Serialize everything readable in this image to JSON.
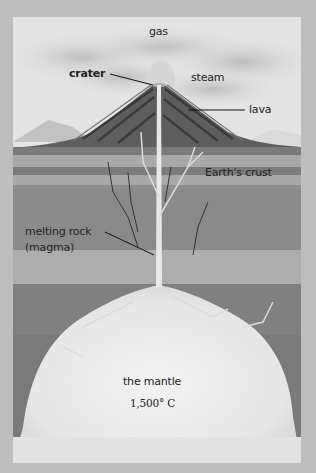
{
  "diagram": {
    "labels": {
      "gas": "gas",
      "crater": "crater",
      "steam": "steam",
      "lava": "lava",
      "crust": "Earth's crust",
      "magma_line1": "melting rock",
      "magma_line2": "(magma)",
      "mantle": "the mantle",
      "mantle_temp": "1,500° C"
    },
    "colors": {
      "sky": "#e4e4e4",
      "cloud": "#c9c9c9",
      "volcano": "#5e5e5e",
      "volcano_stripe": "#3a3a3a",
      "crust_dark": "#7a7a7a",
      "crust_light": "#a9a9a9",
      "mantle_glow": "#ececec",
      "leader_line": "#111111"
    }
  }
}
